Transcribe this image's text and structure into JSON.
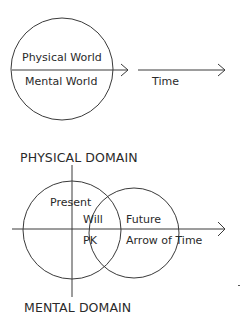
{
  "top_diagram": {
    "upper_label": "Physical World",
    "lower_label": "Mental World",
    "time_label": "Time"
  },
  "bottom_diagram": {
    "top_heading": "PHYSICAL DOMAIN",
    "bottom_heading": "MENTAL DOMAIN",
    "present_label": "Present",
    "will_label": "Will",
    "pk_label": "PK",
    "future_label": "Future",
    "arrow_label": "Arrow of Time"
  },
  "colors": {
    "stroke": "#3a3a3a",
    "text": "#2a2a2a",
    "background": "#ffffff"
  }
}
